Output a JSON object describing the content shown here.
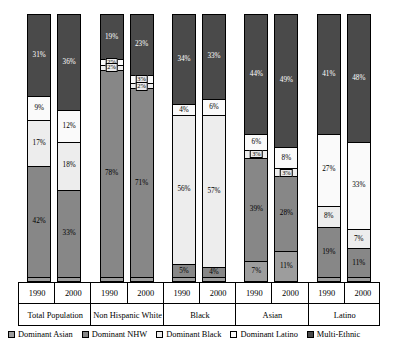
{
  "chart_data": {
    "type": "bar",
    "title": "",
    "xlabel": "",
    "ylabel": "",
    "ylim": [
      0,
      100
    ],
    "stacked": true,
    "grid": false,
    "legend_position": "bottom",
    "categories": [
      "Total Population",
      "Non Hispanic White",
      "Black",
      "Asian",
      "Latino"
    ],
    "years": [
      "1990",
      "2000"
    ],
    "series_order": [
      "Dominant Asian",
      "Dominant NHW",
      "Dominant Black",
      "Dominant Latino",
      "Multi-Ethnic"
    ],
    "colors": {
      "Dominant Asian": "#9d9d9d",
      "Dominant NHW": "#878787",
      "Dominant Black": "#ededed",
      "Dominant Latino": "#fafafa",
      "Multi-Ethnic": "#4a4a4a"
    },
    "bars": [
      {
        "category": "Total Population",
        "year": "1990",
        "segments": [
          {
            "name": "Dominant Asian",
            "value": 1,
            "label": ""
          },
          {
            "name": "Dominant NHW",
            "value": 42,
            "label": "42%"
          },
          {
            "name": "Dominant Black",
            "value": 17,
            "label": "17%"
          },
          {
            "name": "Dominant Latino",
            "value": 9,
            "label": "9%"
          },
          {
            "name": "Multi-Ethnic",
            "value": 31,
            "label": "31%"
          }
        ]
      },
      {
        "category": "Total Population",
        "year": "2000",
        "segments": [
          {
            "name": "Dominant Asian",
            "value": 1,
            "label": ""
          },
          {
            "name": "Dominant NHW",
            "value": 33,
            "label": "33%"
          },
          {
            "name": "Dominant Black",
            "value": 18,
            "label": "18%"
          },
          {
            "name": "Dominant Latino",
            "value": 12,
            "label": "12%"
          },
          {
            "name": "Multi-Ethnic",
            "value": 36,
            "label": "36%"
          }
        ]
      },
      {
        "category": "Non Hispanic White",
        "year": "1990",
        "segments": [
          {
            "name": "Dominant Asian",
            "value": 1,
            "label": ""
          },
          {
            "name": "Dominant NHW",
            "value": 78,
            "label": "78%"
          },
          {
            "name": "Dominant Black",
            "value": 2,
            "label": "2%"
          },
          {
            "name": "Dominant Latino",
            "value": 2,
            "label": "2%"
          },
          {
            "name": "Multi-Ethnic",
            "value": 17,
            "label": "19%"
          }
        ]
      },
      {
        "category": "Non Hispanic White",
        "year": "2000",
        "segments": [
          {
            "name": "Dominant Asian",
            "value": 1,
            "label": ""
          },
          {
            "name": "Dominant NHW",
            "value": 71,
            "label": "71%"
          },
          {
            "name": "Dominant Black",
            "value": 2,
            "label": "2%"
          },
          {
            "name": "Dominant Latino",
            "value": 3,
            "label": "3%"
          },
          {
            "name": "Multi-Ethnic",
            "value": 23,
            "label": "23%"
          }
        ]
      },
      {
        "category": "Black",
        "year": "1990",
        "segments": [
          {
            "name": "Dominant Asian",
            "value": 1,
            "label": ""
          },
          {
            "name": "Dominant NHW",
            "value": 5,
            "label": "5%"
          },
          {
            "name": "Dominant Black",
            "value": 56,
            "label": "56%"
          },
          {
            "name": "Dominant Latino",
            "value": 4,
            "label": "4%"
          },
          {
            "name": "Multi-Ethnic",
            "value": 34,
            "label": "34%"
          }
        ]
      },
      {
        "category": "Black",
        "year": "2000",
        "segments": [
          {
            "name": "Dominant Asian",
            "value": 1,
            "label": ""
          },
          {
            "name": "Dominant NHW",
            "value": 4,
            "label": "4%"
          },
          {
            "name": "Dominant Black",
            "value": 57,
            "label": "57%"
          },
          {
            "name": "Dominant Latino",
            "value": 6,
            "label": "6%"
          },
          {
            "name": "Multi-Ethnic",
            "value": 32,
            "label": "33%"
          }
        ]
      },
      {
        "category": "Asian",
        "year": "1990",
        "segments": [
          {
            "name": "Dominant Asian",
            "value": 7,
            "label": "7%"
          },
          {
            "name": "Dominant NHW",
            "value": 39,
            "label": "39%"
          },
          {
            "name": "Dominant Black",
            "value": 3,
            "label": "3%"
          },
          {
            "name": "Dominant Latino",
            "value": 6,
            "label": "6%"
          },
          {
            "name": "Multi-Ethnic",
            "value": 45,
            "label": "44%"
          }
        ]
      },
      {
        "category": "Asian",
        "year": "2000",
        "segments": [
          {
            "name": "Dominant Asian",
            "value": 11,
            "label": "11%"
          },
          {
            "name": "Dominant NHW",
            "value": 28,
            "label": "28%"
          },
          {
            "name": "Dominant Black",
            "value": 3,
            "label": "3%"
          },
          {
            "name": "Dominant Latino",
            "value": 8,
            "label": "8%"
          },
          {
            "name": "Multi-Ethnic",
            "value": 50,
            "label": "49%"
          }
        ]
      },
      {
        "category": "Latino",
        "year": "1990",
        "segments": [
          {
            "name": "Dominant Asian",
            "value": 1,
            "label": ""
          },
          {
            "name": "Dominant NHW",
            "value": 19,
            "label": "19%"
          },
          {
            "name": "Dominant Black",
            "value": 8,
            "label": "8%"
          },
          {
            "name": "Dominant Latino",
            "value": 27,
            "label": "27%"
          },
          {
            "name": "Multi-Ethnic",
            "value": 45,
            "label": "41%"
          }
        ]
      },
      {
        "category": "Latino",
        "year": "2000",
        "segments": [
          {
            "name": "Dominant Asian",
            "value": 1,
            "label": ""
          },
          {
            "name": "Dominant NHW",
            "value": 11,
            "label": "11%"
          },
          {
            "name": "Dominant Black",
            "value": 7,
            "label": "7%"
          },
          {
            "name": "Dominant Latino",
            "value": 33,
            "label": "33%"
          },
          {
            "name": "Multi-Ethnic",
            "value": 48,
            "label": "48%"
          }
        ]
      }
    ],
    "legend": [
      {
        "label": "Dominant Asian",
        "color": "#9d9d9d"
      },
      {
        "label": "Dominant NHW",
        "color": "#878787"
      },
      {
        "label": "Dominant Black",
        "color": "#ededed"
      },
      {
        "label": "Dominant Latino",
        "color": "#fafafa"
      },
      {
        "label": "Multi-Ethnic",
        "color": "#4a4a4a"
      }
    ]
  }
}
